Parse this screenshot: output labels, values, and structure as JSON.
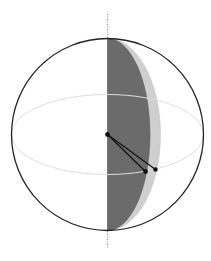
{
  "diagram": {
    "type": "sphere-with-hemisphere-wedge",
    "colors": {
      "background": "#ffffff",
      "sphere_outline": "#222222",
      "equator": "#dddddd",
      "axis": "#888888",
      "dark_lens": "#6b6b6b",
      "light_lens": "#cfcfcf",
      "points": "#111111",
      "segments": "#111111"
    },
    "sphere": {
      "cx": 107.5,
      "cy": 134.5,
      "r": 96
    },
    "equator": {
      "cx": 107.5,
      "cy": 134.5,
      "rx": 96,
      "ry": 40
    },
    "axis": {
      "x": 107,
      "y_top": 14,
      "y_bottom": 249
    },
    "dark_lens": {
      "bulge_x": 150
    },
    "light_lens": {
      "bulge_x": 161
    },
    "points": [
      {
        "name": "center",
        "x": 107.5,
        "y": 134.5
      },
      {
        "name": "point-a",
        "x": 145.5,
        "y": 171.5
      },
      {
        "name": "point-b",
        "x": 155.5,
        "y": 169.5
      }
    ]
  }
}
